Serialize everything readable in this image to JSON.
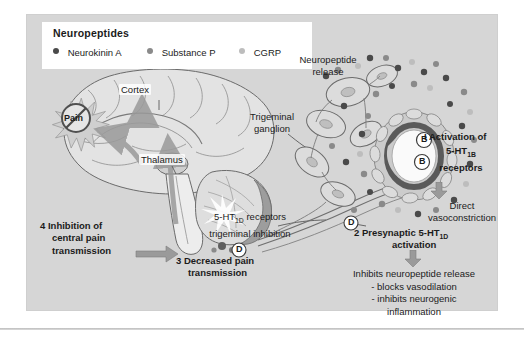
{
  "figure": {
    "background_color": "#d6d6d6",
    "panel_color": "#ffffff"
  },
  "legend": {
    "title": "Neuropeptides",
    "items": [
      {
        "label": "Neurokinin A",
        "color": "#4a4a4a",
        "icon": "legend-dot-dark"
      },
      {
        "label": "Substance P",
        "color": "#8a8a8a",
        "icon": "legend-dot-medium"
      },
      {
        "label": "CGRP",
        "color": "#bdbdbd",
        "icon": "legend-dot-light"
      }
    ]
  },
  "anatomy": {
    "cortex": "Cortex",
    "thalamus": "Thalamus",
    "pain_burst": "Pain",
    "trigeminal_ganglion_line1": "Trigeminal",
    "trigeminal_ganglion_line2": "ganglion",
    "neuropeptide_release_line1": "Neuropeptide",
    "neuropeptide_release_line2": "release",
    "receptor_b_1": "B",
    "receptor_b_2": "B",
    "receptor_d_brainstem": "D",
    "receptor_d_terminal": "D"
  },
  "annotations": {
    "step1": {
      "number": "I",
      "line1": "Activation of",
      "line2_pre": "5-HT",
      "line2_sub": "1B",
      "line3": "receptors",
      "effect_line1": "Direct",
      "effect_line2": "vasoconstriction"
    },
    "step2": {
      "number": "2",
      "line1_pre": "Presynaptic 5-HT",
      "line1_sub": "1D",
      "line2": "activation",
      "effect_title": "Inhibits neuropeptide release",
      "effect_bullets": [
        "- blocks vasodilation",
        "- inhibits neurogenic",
        "inflammation"
      ]
    },
    "step3": {
      "number": "3",
      "line1": "Decreased pain",
      "line2": "transmission"
    },
    "step4": {
      "number": "4",
      "line1": "Inhibition of",
      "line2": "central pain",
      "line3": "transmission"
    },
    "receptor_note": {
      "line1_pre": "5-HT",
      "line1_sub": "1D",
      "line1_post": " receptors",
      "line2": "trigeminal inhibition"
    }
  },
  "colors": {
    "ink": "#1b1b1b",
    "arrow_gray": "#8d8d8d",
    "vessel_dark": "#5a5a5a",
    "tissue_mid": "#9c9c9c",
    "tissue_light": "#c9c9c9"
  }
}
